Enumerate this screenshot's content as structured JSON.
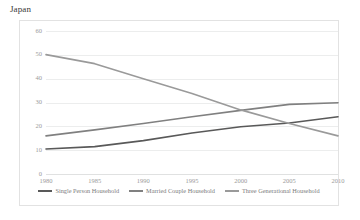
{
  "chart_title": "Japan",
  "chart_data": {
    "type": "line",
    "title": "Japan",
    "xlabel": "",
    "ylabel": "",
    "categories": [
      "1980",
      "1985",
      "1990",
      "1995",
      "2000",
      "2005",
      "2010"
    ],
    "x": [
      1980,
      1985,
      1990,
      1995,
      2000,
      2005,
      2010
    ],
    "ylim": [
      0,
      60
    ],
    "xlim": [
      1980,
      2010
    ],
    "yticks": [
      "60",
      "50",
      "40",
      "30",
      "20",
      "10",
      "0"
    ],
    "ytick_values": [
      60,
      50,
      40,
      30,
      20,
      10,
      0
    ],
    "grid": true,
    "legend_position": "bottom",
    "series": [
      {
        "name": "Single Person Household",
        "color": "#595959",
        "values": [
          10.5,
          11.5,
          14.0,
          17.2,
          19.8,
          21.4,
          24.0
        ]
      },
      {
        "name": "Married Couple Household",
        "color": "#808080",
        "values": [
          16.0,
          18.5,
          21.2,
          24.0,
          26.7,
          29.2,
          29.9
        ]
      },
      {
        "name": "Three Generational Household",
        "color": "#9a9a9a",
        "values": [
          50.1,
          46.3,
          40.0,
          33.8,
          26.9,
          21.2,
          16.0
        ]
      }
    ],
    "legend": [
      "Single Person Household",
      "Married Couple Household",
      "Three Generational Household"
    ]
  },
  "colors": {
    "frame_border": "#e2e2e2",
    "gridline": "#eceded",
    "tick_text": "#9a9a9a",
    "title_text": "#3a3a3a",
    "legend_text": "#7b7b7b",
    "background": "#ffffff"
  }
}
